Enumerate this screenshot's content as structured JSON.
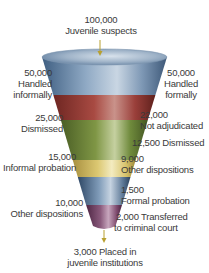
{
  "diagram": {
    "type": "funnel",
    "top": {
      "count": "100,000",
      "label": "Juvenile suspects"
    },
    "left_labels": [
      {
        "count": "50,000",
        "lines": [
          "Handled",
          "informally"
        ]
      },
      {
        "count": "25,000",
        "lines": [
          "Dismissed"
        ]
      },
      {
        "count": "15,000",
        "lines": [
          "Informal probation"
        ]
      },
      {
        "count": "10,000",
        "lines": [
          "Other dispositions"
        ]
      }
    ],
    "right_labels": [
      {
        "count": "50,000",
        "lines": [
          "Handled",
          "formally"
        ]
      },
      {
        "count": "22,000",
        "lines": [
          "Not adjudicated"
        ]
      },
      {
        "text": "12,500 Dismissed"
      },
      {
        "count": "9,000",
        "lines": [
          "Other dispositions"
        ]
      },
      {
        "count": "1,500",
        "lines": [
          "Formal probation"
        ]
      },
      {
        "text": "2,000 Transferred",
        "line2": "to criminal court"
      }
    ],
    "bottom": {
      "line1": "3,000 Placed in",
      "line2": "juvenile institutions"
    },
    "band_colors": {
      "blue": "#6f8fae",
      "red": "#9a3f3a",
      "green": "#6f8a3c",
      "yellow": "#d6c26a",
      "steel": "#5f7a98",
      "purple": "#7e4a6e",
      "arrow": "#b8a030"
    }
  }
}
